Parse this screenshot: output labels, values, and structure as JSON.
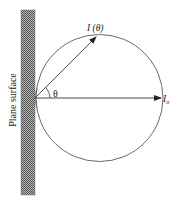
{
  "diagram": {
    "surface_label": "Plane surface",
    "angle_label": "θ",
    "intensity_angle_label": "I (θ)",
    "intensity_normal_label": "I",
    "intensity_normal_subscript": "o",
    "colors": {
      "line": "#333333",
      "hatch_dark": "#555555",
      "hatch_light": "#bbbbbb",
      "background": "#ffffff"
    }
  }
}
